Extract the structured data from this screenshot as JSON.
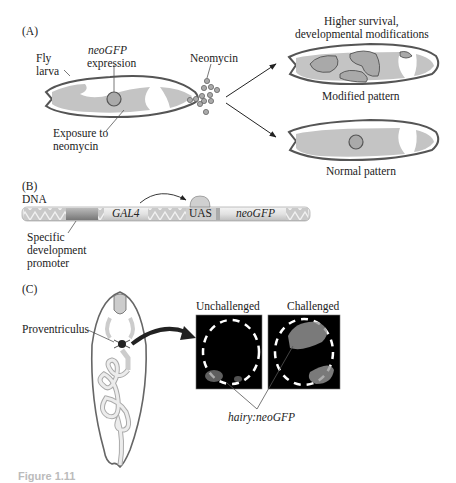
{
  "panel_a": {
    "label": "(A)",
    "fly_larva": "Fly\nlarva",
    "fly_label_1": "Fly",
    "fly_label_2": "larva",
    "neogfp_1": "neoGFP",
    "neogfp_2": "expression",
    "neomycin": "Neomycin",
    "exposure_1": "Exposure to",
    "exposure_2": "neomycin",
    "higher_1": "Higher survival,",
    "higher_2": "developmental modifications",
    "modified": "Modified pattern",
    "normal": "Normal pattern"
  },
  "panel_b": {
    "label": "(B)",
    "dna": "DNA",
    "gal4": "GAL4",
    "uas": "UAS",
    "neogfp": "neoGFP",
    "promoter_1": "Specific",
    "promoter_2": "development",
    "promoter_3": "promoter"
  },
  "panel_c": {
    "label": "(C)",
    "proventriculus": "Proventriculus",
    "unchallenged": "Unchallenged",
    "challenged": "Challenged",
    "hairy": "hairy:neoGFP"
  },
  "caption": "Figure 1.11"
}
